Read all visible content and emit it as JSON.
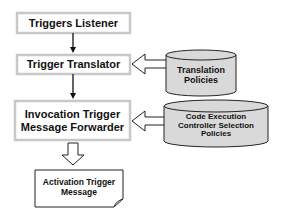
{
  "diagram": {
    "nodes": {
      "triggers_listener": {
        "label": "Triggers Listener"
      },
      "trigger_translator": {
        "label": "Trigger Translator"
      },
      "forwarder": {
        "line1": "Invocation Trigger",
        "line2": "Message Forwarder"
      },
      "translation_policies": {
        "line1": "Translation",
        "line2": "Policies"
      },
      "selection_policies": {
        "line1": "Code Execution",
        "line2": "Controller Selection",
        "line3": "Policies"
      },
      "activation_message": {
        "line1": "Activation Trigger",
        "line2": "Message"
      }
    },
    "edges": [
      {
        "from": "Triggers Listener",
        "to": "Trigger Translator",
        "type": "arrow"
      },
      {
        "from": "Trigger Translator",
        "to": "Invocation Trigger Message Forwarder",
        "type": "arrow"
      },
      {
        "from": "Translation Policies",
        "to": "Trigger Translator",
        "type": "block-arrow"
      },
      {
        "from": "Code Execution Controller Selection Policies",
        "to": "Invocation Trigger Message Forwarder",
        "type": "block-arrow"
      },
      {
        "from": "Invocation Trigger Message Forwarder",
        "to": "Activation Trigger Message",
        "type": "block-arrow"
      }
    ],
    "colors": {
      "box_border": "#c8c8c8",
      "cylinder_fill": "#d9d9d9",
      "line": "#111111"
    }
  }
}
